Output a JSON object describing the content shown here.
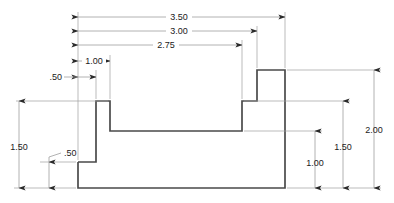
{
  "drawing": {
    "type": "orthographic-part-view",
    "units": "inches",
    "line_color": "#4a4a4a",
    "dim_color": "#9a9a9a",
    "text_color": "#1a1a1a",
    "background": "#ffffff"
  },
  "dimensions": {
    "overall_width": "3.50",
    "width_to_right_step": "3.00",
    "width_to_notch_right": "2.75",
    "width_to_first_riser": "1.00",
    "left_ledge_width": ".50",
    "left_height": "1.50",
    "left_ledge_height": ".50",
    "notch_floor_height": "1.00",
    "shoulder_height": "1.50",
    "overall_height": "2.00"
  },
  "labels": {
    "d_350": "3.50",
    "d_300": "3.00",
    "d_275": "2.75",
    "d_100_top": "1.00",
    "d_050_top": ".50",
    "d_150_left": "1.50",
    "d_050_left": ".50",
    "d_100_right": "1.00",
    "d_150_right": "1.50",
    "d_200_right": "2.00"
  },
  "profile": {
    "description": "Stepped block profile outline",
    "vertices": [
      [
        78,
        162
      ],
      [
        96,
        162
      ],
      [
        96,
        101
      ],
      [
        110,
        101
      ],
      [
        110,
        131
      ],
      [
        242,
        131
      ],
      [
        242,
        101
      ],
      [
        257,
        101
      ],
      [
        257,
        70
      ],
      [
        285,
        70
      ],
      [
        285,
        188
      ],
      [
        78,
        188
      ]
    ]
  }
}
